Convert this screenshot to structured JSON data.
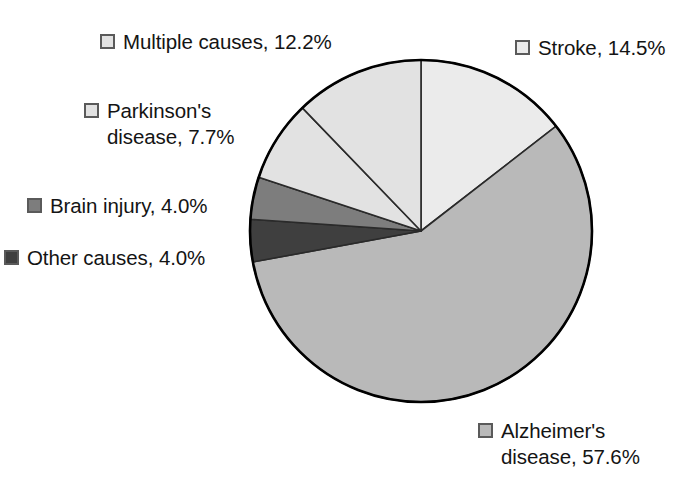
{
  "chart_data": {
    "type": "pie",
    "title": "",
    "subtitle": "",
    "xlabel": "",
    "ylabel": "",
    "legend_position": "callout-around-pie",
    "grid": false,
    "unit": "%",
    "start_angle_deg": 0,
    "direction": "clockwise",
    "categories": [
      "Stroke",
      "Alzheimer's disease",
      "Other causes",
      "Brain injury",
      "Parkinson's disease",
      "Multiple causes"
    ],
    "values": [
      14.5,
      57.6,
      4.0,
      4.0,
      7.7,
      12.2
    ],
    "slices": [
      {
        "id": "stroke",
        "label": "Stroke",
        "value": 14.5,
        "value_text": "14.5%",
        "callout": "Stroke, 14.5%",
        "color": "#ebebeb",
        "swatch_color": "#ebebeb"
      },
      {
        "id": "alzheimers",
        "label": "Alzheimer's disease",
        "value": 57.6,
        "value_text": "57.6%",
        "callout_line1": "Alzheimer's",
        "callout_line2": "disease, 57.6%",
        "color": "#b9b9b9",
        "swatch_color": "#b9b9b9"
      },
      {
        "id": "other-causes",
        "label": "Other causes",
        "value": 4.0,
        "value_text": "4.0%",
        "callout": "Other causes, 4.0%",
        "color": "#3f3f3f",
        "swatch_color": "#3f3f3f"
      },
      {
        "id": "brain-injury",
        "label": "Brain injury",
        "value": 4.0,
        "value_text": "4.0%",
        "callout": "Brain injury, 4.0%",
        "color": "#7d7d7d",
        "swatch_color": "#7d7d7d"
      },
      {
        "id": "parkinsons",
        "label": "Parkinson's disease",
        "value": 7.7,
        "value_text": "7.7%",
        "callout_line1": "Parkinson's",
        "callout_line2": "disease, 7.7%",
        "color": "#e2e2e2",
        "swatch_color": "#e2e2e2"
      },
      {
        "id": "multiple-causes",
        "label": "Multiple causes",
        "value": 12.2,
        "value_text": "12.2%",
        "callout": "Multiple causes, 12.2%",
        "color": "#e2e2e2",
        "swatch_color": "#e2e2e2"
      }
    ],
    "geometry": {
      "center_x": 421,
      "center_y": 231,
      "radius": 171,
      "stroke_color": "#000000",
      "stroke_width": 2.5,
      "slice_divider_color": "#2a2a2a",
      "slice_divider_width": 1.6
    }
  }
}
